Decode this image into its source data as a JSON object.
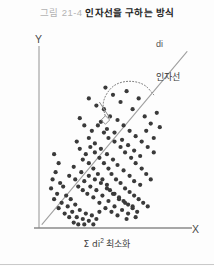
{
  "caption": {
    "number": "그림 21-4",
    "title": "인자선을 구하는 방식"
  },
  "axes": {
    "y_label": "Y",
    "x_label": "X"
  },
  "annotations": {
    "residual_label": "di",
    "line_label": "인자선",
    "objective_prefix": "Σ di",
    "objective_superscript": "2",
    "objective_suffix": "최소화"
  },
  "colors": {
    "point": "#3a3a3a",
    "axis": "#8c8c8c",
    "fit_line": "#9a9a9a",
    "leader": "#6f6f6f",
    "caption_number": "#b3b3b3",
    "caption_title": "#1c1c1c",
    "background": "#fdfdfd"
  },
  "chart_data": {
    "type": "scatter",
    "title": "인자선을 구하는 방식",
    "xlabel": "X",
    "ylabel": "Y",
    "xlim": [
      0,
      100
    ],
    "ylim": [
      0,
      100
    ],
    "grid": false,
    "legend": false,
    "annotations": [
      {
        "text": "di",
        "x": 79,
        "y": 90,
        "role": "residual-label"
      },
      {
        "text": "인자선",
        "x": 79,
        "y": 72,
        "role": "fit-line-label"
      },
      {
        "text": "Σ di² 최소화",
        "x": 50,
        "y": -12,
        "role": "objective-caption"
      }
    ],
    "fit_line": {
      "name": "인자선",
      "x": [
        2,
        98
      ],
      "y": [
        2,
        98
      ],
      "style": "solid"
    },
    "leader_curve": {
      "style": "dotted",
      "comment": "curved leader from 인자선/di labels to the perpendicular residual marker",
      "x": [
        76,
        70,
        60,
        50,
        44,
        42,
        44
      ],
      "y": [
        74,
        80,
        82,
        80,
        74,
        68,
        62
      ]
    },
    "residual_marker": {
      "comment": "right-angle square where residual meets the fit line",
      "x": 44,
      "y": 60
    },
    "residual_segment": {
      "x": [
        40,
        47
      ],
      "y": [
        70,
        61
      ]
    },
    "points": [
      [
        10,
        41
      ],
      [
        13,
        36
      ],
      [
        11,
        31
      ],
      [
        9,
        27
      ],
      [
        14,
        25
      ],
      [
        8,
        22
      ],
      [
        12,
        19
      ],
      [
        16,
        23
      ],
      [
        10,
        16
      ],
      [
        15,
        14
      ],
      [
        18,
        18
      ],
      [
        13,
        11
      ],
      [
        19,
        12
      ],
      [
        21,
        16
      ],
      [
        17,
        8
      ],
      [
        22,
        9
      ],
      [
        24,
        13
      ],
      [
        20,
        6
      ],
      [
        25,
        6
      ],
      [
        27,
        10
      ],
      [
        23,
        3
      ],
      [
        29,
        5
      ],
      [
        31,
        8
      ],
      [
        26,
        2
      ],
      [
        33,
        4
      ],
      [
        35,
        7
      ],
      [
        30,
        2
      ],
      [
        38,
        5
      ],
      [
        40,
        9
      ],
      [
        36,
        2
      ],
      [
        20,
        29
      ],
      [
        24,
        27
      ],
      [
        28,
        31
      ],
      [
        23,
        34
      ],
      [
        26,
        23
      ],
      [
        30,
        26
      ],
      [
        33,
        29
      ],
      [
        29,
        21
      ],
      [
        34,
        23
      ],
      [
        37,
        27
      ],
      [
        32,
        19
      ],
      [
        38,
        21
      ],
      [
        41,
        25
      ],
      [
        36,
        17
      ],
      [
        42,
        18
      ],
      [
        45,
        22
      ],
      [
        40,
        14
      ],
      [
        46,
        15
      ],
      [
        49,
        19
      ],
      [
        44,
        11
      ],
      [
        50,
        12
      ],
      [
        53,
        16
      ],
      [
        48,
        9
      ],
      [
        55,
        10
      ],
      [
        57,
        14
      ],
      [
        52,
        7
      ],
      [
        59,
        8
      ],
      [
        62,
        12
      ],
      [
        58,
        5
      ],
      [
        64,
        6
      ],
      [
        27,
        44
      ],
      [
        31,
        41
      ],
      [
        25,
        48
      ],
      [
        34,
        45
      ],
      [
        29,
        38
      ],
      [
        37,
        42
      ],
      [
        33,
        36
      ],
      [
        40,
        39
      ],
      [
        36,
        33
      ],
      [
        43,
        36
      ],
      [
        39,
        30
      ],
      [
        46,
        33
      ],
      [
        42,
        27
      ],
      [
        48,
        30
      ],
      [
        45,
        24
      ],
      [
        51,
        27
      ],
      [
        47,
        21
      ],
      [
        54,
        25
      ],
      [
        50,
        19
      ],
      [
        57,
        22
      ],
      [
        53,
        17
      ],
      [
        60,
        20
      ],
      [
        56,
        15
      ],
      [
        63,
        18
      ],
      [
        59,
        13
      ],
      [
        66,
        16
      ],
      [
        62,
        11
      ],
      [
        69,
        14
      ],
      [
        65,
        9
      ],
      [
        72,
        12
      ],
      [
        30,
        57
      ],
      [
        35,
        54
      ],
      [
        27,
        61
      ],
      [
        39,
        57
      ],
      [
        33,
        50
      ],
      [
        43,
        53
      ],
      [
        37,
        47
      ],
      [
        46,
        50
      ],
      [
        41,
        44
      ],
      [
        50,
        48
      ],
      [
        45,
        41
      ],
      [
        54,
        45
      ],
      [
        49,
        38
      ],
      [
        57,
        42
      ],
      [
        52,
        35
      ],
      [
        61,
        39
      ],
      [
        56,
        32
      ],
      [
        64,
        36
      ],
      [
        60,
        29
      ],
      [
        68,
        33
      ],
      [
        63,
        26
      ],
      [
        71,
        30
      ],
      [
        67,
        24
      ],
      [
        74,
        27
      ],
      [
        38,
        68
      ],
      [
        33,
        72
      ],
      [
        43,
        66
      ],
      [
        47,
        62
      ],
      [
        41,
        59
      ],
      [
        52,
        60
      ],
      [
        45,
        55
      ],
      [
        56,
        57
      ],
      [
        50,
        53
      ],
      [
        60,
        54
      ],
      [
        55,
        49
      ],
      [
        64,
        51
      ],
      [
        59,
        46
      ],
      [
        68,
        48
      ],
      [
        63,
        43
      ],
      [
        72,
        45
      ],
      [
        67,
        40
      ],
      [
        76,
        42
      ],
      [
        44,
        78
      ],
      [
        49,
        74
      ],
      [
        54,
        70
      ],
      [
        58,
        76
      ],
      [
        62,
        66
      ],
      [
        66,
        72
      ],
      [
        70,
        62
      ],
      [
        74,
        58
      ],
      [
        78,
        64
      ],
      [
        71,
        54
      ],
      [
        76,
        50
      ],
      [
        80,
        56
      ]
    ]
  }
}
